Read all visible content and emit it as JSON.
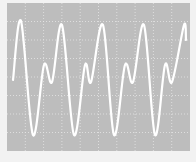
{
  "chart_data": {
    "type": "line",
    "title": "",
    "xlabel": "",
    "ylabel": "",
    "grid": true,
    "grid_divisions": {
      "x": 10,
      "y": 8
    },
    "legend": null,
    "colors": {
      "screen_background": "#bdbdbd",
      "trace": "#ffffff",
      "grid": "#e6e6e6",
      "frame": "#f2f2f2"
    },
    "series": [
      {
        "name": "trace",
        "points": [
          [
            13,
            80
          ],
          [
            21,
            21
          ],
          [
            33,
            135
          ],
          [
            44,
            65
          ],
          [
            52,
            82
          ],
          [
            62,
            25
          ],
          [
            74,
            135
          ],
          [
            85,
            65
          ],
          [
            91,
            82
          ],
          [
            103,
            25
          ],
          [
            114,
            135
          ],
          [
            125,
            65
          ],
          [
            133,
            82
          ],
          [
            144,
            25
          ],
          [
            155,
            135
          ],
          [
            165,
            65
          ],
          [
            172,
            82
          ],
          [
            184,
            25
          ],
          [
            186,
            40
          ]
        ]
      }
    ],
    "xlim": [
      0,
      196
    ],
    "ylim": [
      0,
      162
    ]
  }
}
